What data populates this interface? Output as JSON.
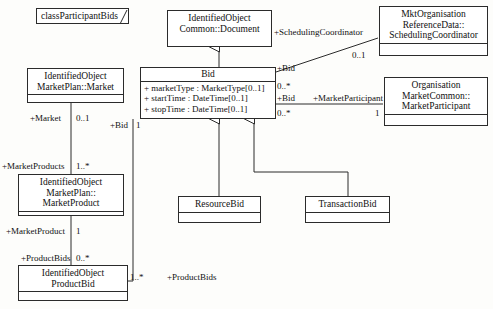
{
  "diagram": {
    "title_tag": "classParticipantBids",
    "background": "#fdfdfb",
    "line_color": "#2b2b2b"
  },
  "classes": {
    "document": {
      "name": "IdentifiedObject\nCommon::Document"
    },
    "market": {
      "name": "IdentifiedObject\nMarketPlan::Market"
    },
    "bid": {
      "name": "Bid",
      "attributes": [
        "+ marketType : MarketType[0..1]",
        "+ startTime : DateTime[0..1]",
        "+ stopTime : DateTime[0..1]"
      ]
    },
    "scheduling_coordinator": {
      "name": "MktOrganisation\nReferenceData::\nSchedulingCoordinator"
    },
    "market_participant": {
      "name": "Organisation\nMarketCommon::\nMarketParticipant"
    },
    "market_product": {
      "name": "IdentifiedObject\nMarketPlan::\nMarketProduct"
    },
    "resource_bid": {
      "name": "ResourceBid"
    },
    "transaction_bid": {
      "name": "TransactionBid"
    },
    "product_bid": {
      "name": "IdentifiedObject\nProductBid"
    }
  },
  "association_labels": {
    "market_role": "+Market",
    "market_mult": "0..1",
    "market_products_role": "+MarketProducts",
    "market_products_mult": "1..*",
    "market_product_role": "+MarketProduct",
    "market_product_mult": "1",
    "product_bids_role_left": "+ProductBids",
    "product_bids_mult_left": "0..*",
    "bid_role_left": "+Bid",
    "bid_mult_left": "1",
    "product_bids_mult_right": "1..*",
    "product_bids_role_right": "+ProductBids",
    "scheduling_coordinator_role": "+SchedulingCoordinator",
    "scheduling_coordinator_mult": "0..1",
    "bid_role_sc": "+Bid",
    "bid_mult_sc": "0..*",
    "bid_role_mp": "+Bid",
    "bid_mult_mp": "0..*",
    "market_participant_role": "+MarketParticipant",
    "market_participant_mult": "1"
  }
}
